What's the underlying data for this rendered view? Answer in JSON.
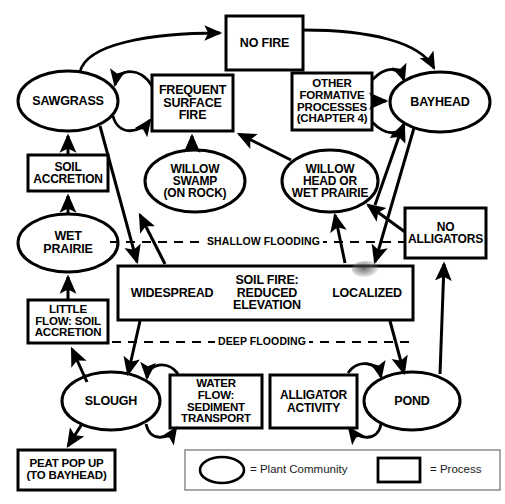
{
  "figure": {
    "stroke_color": "#000000",
    "fill_color": "#ffffff"
  },
  "nodes": {
    "no_fire": {
      "label": "NO FIRE",
      "shape": "process"
    },
    "sawgrass": {
      "label": "SAWGRASS",
      "shape": "plant-community"
    },
    "frequent_surface_fire": {
      "label": "FREQUENT\nSURFACE\nFIRE",
      "shape": "process"
    },
    "other_formative_processes": {
      "label": "OTHER\nFORMATIVE\nPROCESSES\n(CHAPTER 4)",
      "shape": "process"
    },
    "bayhead": {
      "label": "BAYHEAD",
      "shape": "plant-community"
    },
    "soil_accretion": {
      "label": "SOIL\nACCRETION",
      "shape": "process"
    },
    "willow_swamp": {
      "label": "WILLOW\nSWAMP\n(ON ROCK)",
      "shape": "plant-community"
    },
    "willow_head": {
      "label": "WILLOW\nHEAD  OR\nWET PRAIRIE",
      "shape": "plant-community"
    },
    "wet_prairie": {
      "label": "WET\nPRAIRIE",
      "shape": "plant-community"
    },
    "no_alligators": {
      "label": "NO\nALLIGATORS",
      "shape": "process"
    },
    "soil_fire": {
      "label_center": "SOIL FIRE:\nREDUCED\nELEVATION",
      "label_left": "WIDESPREAD",
      "label_right": "LOCALIZED",
      "shape": "process"
    },
    "little_flow": {
      "label": "LITTLE\nFLOW: SOIL\nACCRETION",
      "shape": "process"
    },
    "slough": {
      "label": "SLOUGH",
      "shape": "plant-community"
    },
    "water_flow": {
      "label": "WATER\nFLOW:\nSEDIMENT\nTRANSPORT",
      "shape": "process"
    },
    "alligator_activity": {
      "label": "ALLIGATOR\nACTIVITY",
      "shape": "process"
    },
    "pond": {
      "label": "POND",
      "shape": "plant-community"
    },
    "peat_pop_up": {
      "label": "PEAT POP UP\n(TO BAYHEAD)",
      "shape": "process"
    }
  },
  "dividers": {
    "shallow_flooding": "SHALLOW FLOODING",
    "deep_flooding": "DEEP FLOODING"
  },
  "legend": {
    "plant_community": "= Plant Community",
    "process": "= Process"
  }
}
